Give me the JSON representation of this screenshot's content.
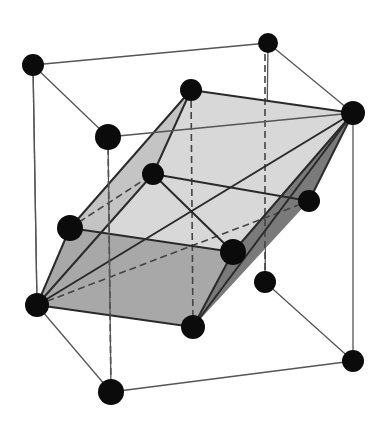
{
  "diagram": {
    "type": "crystal-lattice",
    "colors": {
      "background": "#ffffff",
      "atom": "#0b0b0b",
      "cube_edge": "#555555",
      "face_light": "#d6d6d6",
      "face_mid": "#a9a9a9",
      "face_dark": "#7d7d7d"
    },
    "atoms": [
      {
        "id": "cube-back-top-left",
        "x": 33,
        "y": 65,
        "r": 11
      },
      {
        "id": "cube-back-top-right",
        "x": 268,
        "y": 43,
        "r": 10
      },
      {
        "id": "cube-front-top-left",
        "x": 108,
        "y": 137,
        "r": 13
      },
      {
        "id": "cube-front-top-right",
        "x": 353,
        "y": 113,
        "r": 12
      },
      {
        "id": "rhombo-top",
        "x": 191,
        "y": 90,
        "r": 11
      },
      {
        "id": "rhombo-inner",
        "x": 153,
        "y": 174,
        "r": 11
      },
      {
        "id": "rhombo-right",
        "x": 309,
        "y": 201,
        "r": 11
      },
      {
        "id": "rhombo-left",
        "x": 70,
        "y": 228,
        "r": 13
      },
      {
        "id": "rhombo-front",
        "x": 233,
        "y": 252,
        "r": 13
      },
      {
        "id": "cube-back-bottom-right",
        "x": 265,
        "y": 282,
        "r": 11
      },
      {
        "id": "cube-back-bottom-left",
        "x": 37,
        "y": 305,
        "r": 12
      },
      {
        "id": "rhombo-bottom",
        "x": 193,
        "y": 327,
        "r": 12
      },
      {
        "id": "cube-front-bottom-right",
        "x": 353,
        "y": 361,
        "r": 11
      },
      {
        "id": "cube-front-bottom-left",
        "x": 111,
        "y": 392,
        "r": 13
      }
    ]
  }
}
